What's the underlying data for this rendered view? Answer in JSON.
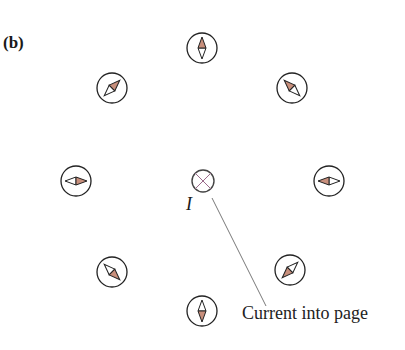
{
  "figure": {
    "panel_label": "(b)",
    "current_label": "I",
    "annotation": "Current into page",
    "colors": {
      "needle_north": "#c88f7c",
      "needle_south": "#ffffff",
      "stroke": "#222222",
      "current_symbol": "#9a6a8a",
      "leader_line": "#555555"
    },
    "current_symbol": {
      "x": 203,
      "y": 181,
      "r": 11,
      "type": "cross-into-page"
    },
    "compasses": [
      {
        "id": "top",
        "x": 202,
        "y": 48,
        "north_angle_deg": 90
      },
      {
        "id": "upper-right",
        "x": 292,
        "y": 88,
        "north_angle_deg": 135
      },
      {
        "id": "right",
        "x": 329,
        "y": 181,
        "north_angle_deg": 180
      },
      {
        "id": "lower-right",
        "x": 290,
        "y": 270,
        "north_angle_deg": 225
      },
      {
        "id": "bottom",
        "x": 202,
        "y": 311,
        "north_angle_deg": 270
      },
      {
        "id": "lower-left",
        "x": 112,
        "y": 272,
        "north_angle_deg": 315
      },
      {
        "id": "left",
        "x": 76,
        "y": 181,
        "north_angle_deg": 0
      },
      {
        "id": "upper-left",
        "x": 112,
        "y": 88,
        "north_angle_deg": 45
      }
    ]
  }
}
